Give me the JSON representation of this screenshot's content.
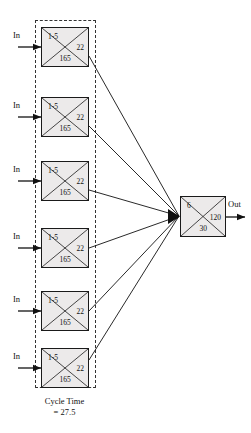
{
  "diagram": {
    "type": "process-flow",
    "canvas": {
      "width": 251,
      "height": 433
    },
    "group": {
      "caption_line1": "Cycle Time",
      "caption_line2": "= 27.5",
      "border_style": "dashed",
      "box": {
        "x": 35,
        "y": 20,
        "width": 61,
        "height": 368
      }
    },
    "parallel_stations": [
      {
        "id": "station-1",
        "input_label": "In",
        "top_value": "1-5",
        "right_value": "22",
        "bottom_value": "165",
        "box": {
          "x": 41,
          "y": 27,
          "width": 48,
          "height": 40
        }
      },
      {
        "id": "station-2",
        "input_label": "In",
        "top_value": "1-5",
        "right_value": "22",
        "bottom_value": "165",
        "box": {
          "x": 41,
          "y": 97,
          "width": 48,
          "height": 40
        }
      },
      {
        "id": "station-3",
        "input_label": "In",
        "top_value": "1-5",
        "right_value": "22",
        "bottom_value": "165",
        "box": {
          "x": 41,
          "y": 161,
          "width": 48,
          "height": 40
        }
      },
      {
        "id": "station-4",
        "input_label": "In",
        "top_value": "1-5",
        "right_value": "22",
        "bottom_value": "165",
        "box": {
          "x": 41,
          "y": 228,
          "width": 48,
          "height": 40
        }
      },
      {
        "id": "station-5",
        "input_label": "In",
        "top_value": "1-5",
        "right_value": "22",
        "bottom_value": "165",
        "box": {
          "x": 41,
          "y": 291,
          "width": 48,
          "height": 40
        }
      },
      {
        "id": "station-6",
        "input_label": "In",
        "top_value": "1-5",
        "right_value": "22",
        "bottom_value": "165",
        "box": {
          "x": 41,
          "y": 348,
          "width": 48,
          "height": 40
        }
      }
    ],
    "output_station": {
      "id": "station-out",
      "output_label": "Out",
      "top_value": "6",
      "right_value": "120",
      "bottom_value": "30",
      "box": {
        "x": 180,
        "y": 196,
        "width": 46,
        "height": 41
      }
    },
    "colors": {
      "node_fill": "#eceaea",
      "stroke": "#1a1a1a",
      "dashed_stroke": "#333333",
      "text": "#111111",
      "background": "#ffffff"
    }
  }
}
